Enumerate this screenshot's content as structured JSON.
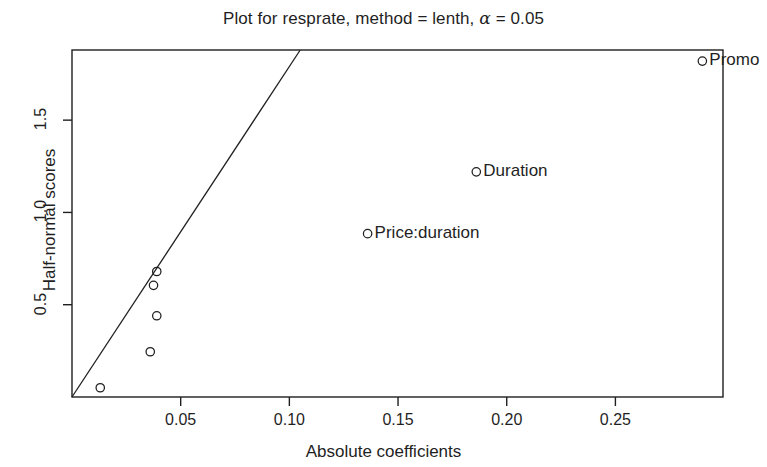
{
  "chart_data": {
    "type": "scatter",
    "title": "Plot for resprate, method = lenth, α = 0.05",
    "title_prefix": "Plot for resprate, method = lenth, ",
    "title_alpha": "α",
    "title_suffix": " = 0.05",
    "xlabel": "Absolute coefficients",
    "ylabel": "Half-normal scores",
    "xlim": [
      0.0,
      0.2995
    ],
    "ylim": [
      0.0,
      1.88
    ],
    "xticks": [
      0.05,
      0.1,
      0.15,
      0.2,
      0.25
    ],
    "xtick_labels": [
      "0.05",
      "0.10",
      "0.15",
      "0.20",
      "0.25"
    ],
    "yticks": [
      0.5,
      1.0,
      1.5
    ],
    "ytick_labels": [
      "0.5",
      "1.0",
      "1.5"
    ],
    "grid": false,
    "legend": null,
    "box": true,
    "points": [
      {
        "label": "",
        "x": 0.013,
        "y": 0.05
      },
      {
        "label": "",
        "x": 0.036,
        "y": 0.245
      },
      {
        "label": "",
        "x": 0.039,
        "y": 0.44
      },
      {
        "label": "",
        "x": 0.0375,
        "y": 0.605
      },
      {
        "label": "",
        "x": 0.039,
        "y": 0.68
      },
      {
        "label": "Price:duration",
        "x": 0.136,
        "y": 0.885
      },
      {
        "label": "Duration",
        "x": 0.186,
        "y": 1.22
      },
      {
        "label": "Promo",
        "x": 0.29,
        "y": 1.82
      }
    ],
    "reference_line": {
      "x0": 0.0,
      "y0": 0.0,
      "x1": 0.105,
      "y1": 1.88
    },
    "point_marker": "open-circle",
    "line_color": "#1f1f1f",
    "point_color": "#1f1f1f",
    "axis_color": "#1f1f1f",
    "background": "#ffffff"
  },
  "plot_box": {
    "left": 72,
    "top": 50,
    "right": 723,
    "bottom": 397
  }
}
